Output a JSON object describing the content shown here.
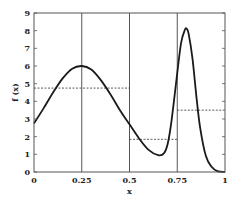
{
  "chart_data": {
    "type": "line",
    "title": "",
    "xlabel": "x",
    "ylabel": "f (x)",
    "xlim": [
      0,
      1
    ],
    "ylim": [
      0,
      9
    ],
    "x_ticks": [
      "0",
      "0.25",
      "0.5",
      "0.75",
      "1"
    ],
    "y_ticks": [
      "0",
      "1",
      "2",
      "3",
      "4",
      "5",
      "6",
      "7",
      "8",
      "9"
    ],
    "grid": "vertical lines at x=0.25, 0.5, 0.75",
    "legend": null,
    "series": [
      {
        "name": "f(x)",
        "style": "solid",
        "x": [
          0,
          0.05,
          0.1,
          0.15,
          0.2,
          0.25,
          0.3,
          0.35,
          0.4,
          0.45,
          0.5,
          0.55,
          0.6,
          0.65,
          0.68,
          0.7,
          0.72,
          0.75,
          0.77,
          0.79,
          0.8,
          0.81,
          0.83,
          0.85,
          0.87,
          0.9,
          0.93,
          0.96,
          1.0
        ],
        "values": [
          2.75,
          3.6,
          4.5,
          5.3,
          5.85,
          6.0,
          5.8,
          5.2,
          4.4,
          3.5,
          2.7,
          1.9,
          1.25,
          0.95,
          1.05,
          1.6,
          2.9,
          5.6,
          7.3,
          8.05,
          8.1,
          7.8,
          6.4,
          4.3,
          2.5,
          0.9,
          0.3,
          0.05,
          0.0
        ]
      },
      {
        "name": "piecewise averages",
        "style": "dashed",
        "segments": [
          {
            "x0": 0,
            "x1": 0.5,
            "y": 4.75
          },
          {
            "x0": 0.5,
            "x1": 0.75,
            "y": 1.85
          },
          {
            "x0": 0.75,
            "x1": 1.0,
            "y": 3.5
          }
        ]
      }
    ]
  },
  "axes": {
    "xlabel": "x",
    "ylabel": "f (x)"
  }
}
